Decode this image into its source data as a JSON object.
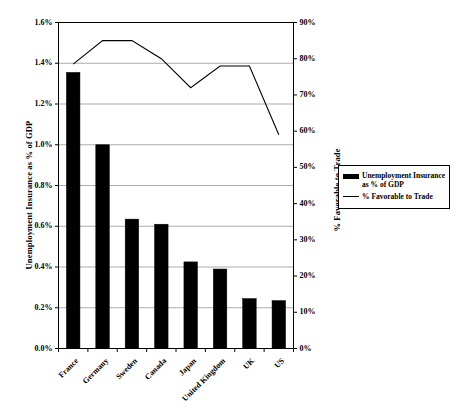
{
  "chart_data": {
    "type": "bar",
    "title": "",
    "subtitle": "",
    "categories": [
      "France",
      "Germany",
      "Sweden",
      "Canada",
      "Japan",
      "United Kingdom",
      "UK",
      "US"
    ],
    "series": [
      {
        "name": "Unemployment Insurance as % of GDP",
        "type": "bar",
        "axis": "left",
        "values": [
          1.355,
          1.0,
          0.635,
          0.61,
          0.425,
          0.39,
          0.245,
          0.235
        ],
        "color": "#000000"
      },
      {
        "name": "% Favorable to Trade",
        "type": "line",
        "axis": "right",
        "values": [
          78.5,
          85.0,
          85.0,
          80.0,
          72.0,
          78.0,
          78.0,
          59.0
        ],
        "color": "#000000"
      }
    ],
    "xlabel": "",
    "ylabel": "Unemployment Insurance as % of GDP",
    "y2label": "% Favorable to Trade",
    "ylim": [
      0,
      1.6
    ],
    "y2lim": [
      0,
      90
    ],
    "yticks": [
      "0.0%",
      "0.2%",
      "0.4%",
      "0.6%",
      "0.8%",
      "1.0%",
      "1.2%",
      "1.4%",
      "1.6%"
    ],
    "ytick_values": [
      0,
      0.2,
      0.4,
      0.6,
      0.8,
      1.0,
      1.2,
      1.4,
      1.6
    ],
    "y2ticks": [
      "0%",
      "10%",
      "20%",
      "30%",
      "40%",
      "50%",
      "60%",
      "70%",
      "80%",
      "90%"
    ],
    "y2tick_values": [
      0,
      10,
      20,
      30,
      40,
      50,
      60,
      70,
      80,
      90
    ],
    "grid": true,
    "legend_position": "right",
    "legend": [
      {
        "label_line1": "Unemployment Insurance",
        "label_line2": "as % of GDP",
        "marker": "bar-swatch"
      },
      {
        "label_line1": "% Favorable to Trade",
        "label_line2": "",
        "marker": "line-swatch"
      }
    ]
  }
}
